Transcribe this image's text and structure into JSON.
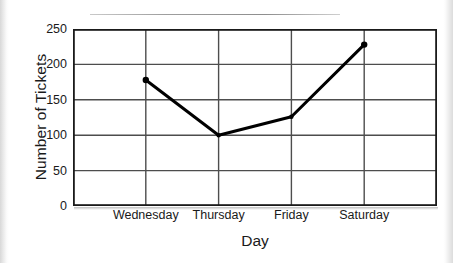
{
  "figure": {
    "background_color": "#ffffff",
    "line_color": "#000000",
    "axis_color": "#1a1a1a",
    "grid_color": "#4d4d4d"
  },
  "axes": {
    "y_title": "Number of Tickets",
    "x_title": "Day"
  },
  "chart_data": {
    "type": "line",
    "title": "",
    "subtitle": "",
    "xlabel": "Day",
    "ylabel": "Number of Tickets",
    "categories": [
      "Wednesday",
      "Thursday",
      "Friday",
      "Saturday"
    ],
    "values": [
      178,
      100,
      126,
      228
    ],
    "series": [
      {
        "name": "Number of Tickets",
        "values": [
          178,
          100,
          126,
          228
        ],
        "color": "#000000",
        "marker": "circle",
        "line_width": 3
      }
    ],
    "ylim": [
      0,
      250
    ],
    "ytick_labels": [
      "0",
      "50",
      "100",
      "150",
      "200",
      "250"
    ],
    "ytick_values": [
      0,
      50,
      100,
      150,
      200,
      250
    ],
    "xtick_labels": [
      "Wednesday",
      "Thursday",
      "Friday",
      "Saturday"
    ],
    "grid": true,
    "grid_orientation": "both",
    "grid_columns": 5,
    "legend": false,
    "legend_position": "none",
    "annotations": []
  }
}
